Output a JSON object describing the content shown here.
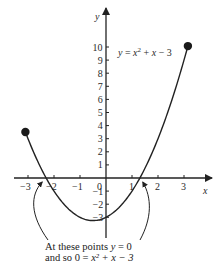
{
  "chart_data": {
    "type": "line",
    "title": "",
    "function": "y = x^2 + x - 3",
    "curve_label": "y = x² + x − 3",
    "xlabel": "x",
    "ylabel": "y",
    "xlim": [
      -3.5,
      4
    ],
    "ylim": [
      -3.3,
      11.5
    ],
    "x_ticks": [
      -3,
      -2,
      -1,
      0,
      1,
      2,
      3
    ],
    "x_tick_labels": [
      "−3",
      "−2",
      "−1",
      "0",
      "1",
      "2",
      "3"
    ],
    "y_ticks": [
      1,
      2,
      3,
      4,
      5,
      6,
      7,
      8,
      9,
      10,
      -1,
      -2,
      -3
    ],
    "y_tick_labels": [
      "1",
      "2",
      "3",
      "4",
      "5",
      "6",
      "7",
      "8",
      "9",
      "10",
      "−1",
      "−2",
      "−3"
    ],
    "series": [
      {
        "name": "y = x² + x − 3",
        "x": [
          -3.1,
          -3,
          -2.5,
          -2,
          -1.5,
          -1,
          -0.5,
          0,
          0.5,
          1,
          1.5,
          2,
          2.5,
          3,
          3.15
        ],
        "y": [
          3.51,
          3,
          0.75,
          -1,
          -2.25,
          -3,
          -3.25,
          -3,
          -2.25,
          -1,
          0.75,
          3,
          5.75,
          9,
          10.07
        ]
      }
    ],
    "endpoints": [
      {
        "x": -3.1,
        "y": 3.51
      },
      {
        "x": 3.15,
        "y": 10.07
      }
    ],
    "roots": [
      -2.3,
      1.3
    ],
    "grid": false,
    "legend": "none",
    "annotation": {
      "line1_prefix": "At these points ",
      "line1_var": "y",
      "line1_suffix": " = 0",
      "line2_prefix": "and so 0 = ",
      "line2_expr": "x² + x − 3"
    }
  },
  "labels": {
    "x_axis": "x",
    "y_axis": "y",
    "eq_y": "y",
    "eq_eq": " = ",
    "eq_x2": "x",
    "eq_sup": "2",
    "eq_rest_plus": " + ",
    "eq_x": "x",
    "eq_minus3": " − 3"
  }
}
